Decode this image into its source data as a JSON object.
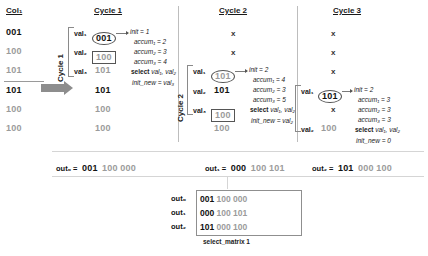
{
  "figure": {
    "col_header": "Col₁",
    "col_values": [
      {
        "text": "001",
        "tone": "dark"
      },
      {
        "text": "100",
        "tone": "gray"
      },
      {
        "text": "101",
        "tone": "gray"
      },
      {
        "text": "101",
        "tone": "dark"
      },
      {
        "text": "100",
        "tone": "gray"
      },
      {
        "text": "100",
        "tone": "gray"
      }
    ],
    "arrow_label": "Cycle 1",
    "cycle2_label": "Cycle 2",
    "cycles": [
      {
        "title": "Cycle 1",
        "rows": [
          {
            "label": "val₁",
            "text": "001",
            "tone": "dark",
            "mark": "circle"
          },
          {
            "label": "val₂",
            "text": "100",
            "tone": "gray",
            "mark": "box"
          },
          {
            "label": "val₃",
            "text": "101",
            "tone": "gray",
            "mark": "none"
          },
          {
            "label": "",
            "text": "101",
            "tone": "dark",
            "mark": "none"
          },
          {
            "label": "",
            "text": "100",
            "tone": "gray",
            "mark": "none"
          },
          {
            "label": "",
            "text": "100",
            "tone": "gray",
            "mark": "none"
          }
        ],
        "annotations": [
          {
            "kind": "italic",
            "text": "init = 1"
          },
          {
            "kind": "italic",
            "text": "accum₁ = 2"
          },
          {
            "kind": "italic",
            "text": "accum₂ = 3"
          },
          {
            "kind": "italic",
            "text": "accum₃ = 4"
          },
          {
            "kind": "select",
            "bold": "select",
            "rest": "val₁, val₂"
          },
          {
            "kind": "italic",
            "text": "init_new  = val₃"
          }
        ]
      },
      {
        "title": "Cycle 2",
        "rows": [
          {
            "label": "",
            "text": "x",
            "tone": "dark",
            "mark": "none"
          },
          {
            "label": "",
            "text": "x",
            "tone": "gray",
            "mark": "none"
          },
          {
            "label": "val₁",
            "text": "101",
            "tone": "gray",
            "mark": "circle"
          },
          {
            "label": "val₂",
            "text": "101",
            "tone": "dark",
            "mark": "none"
          },
          {
            "label": "val₃",
            "text": "100",
            "tone": "gray",
            "mark": "box"
          },
          {
            "label": "",
            "text": "100",
            "tone": "gray",
            "mark": "none"
          }
        ],
        "annotations": [
          {
            "kind": "italic",
            "text": "init = 2"
          },
          {
            "kind": "italic",
            "text": "accum₁ = 4"
          },
          {
            "kind": "italic",
            "text": "accum₂ = 3"
          },
          {
            "kind": "italic",
            "text": "accum₃ = 5"
          },
          {
            "kind": "select",
            "bold": "select",
            "rest": "val₁, val₂"
          },
          {
            "kind": "italic",
            "text": "init_new  = val₂"
          }
        ]
      },
      {
        "title": "Cycle 3",
        "rows": [
          {
            "label": "",
            "text": "x",
            "tone": "dark",
            "mark": "none"
          },
          {
            "label": "",
            "text": "x",
            "tone": "gray",
            "mark": "none"
          },
          {
            "label": "",
            "text": "x",
            "tone": "gray",
            "mark": "none"
          },
          {
            "label": "val₁",
            "text": "101",
            "tone": "dark",
            "mark": "circle"
          },
          {
            "label": "",
            "text": "x",
            "tone": "gray",
            "mark": "none"
          },
          {
            "label": "val₂",
            "text": "100",
            "tone": "gray",
            "mark": "none"
          }
        ],
        "annotations": [
          {
            "kind": "italic",
            "text": "init = 2"
          },
          {
            "kind": "italic",
            "text": "accum₁ = 3"
          },
          {
            "kind": "italic",
            "text": "accum₂ = 3"
          },
          {
            "kind": "italic",
            "text": "accum₃ = 3"
          },
          {
            "kind": "select",
            "bold": "select",
            "rest": "val₁, val₂"
          },
          {
            "kind": "italic",
            "text": "init_new  = 0"
          }
        ]
      }
    ],
    "outputs": [
      {
        "label": "out₀ =",
        "dark": "001",
        "gray": "100 000"
      },
      {
        "label": "out₁ =",
        "dark": "000",
        "gray": "100 101"
      },
      {
        "label": "out₂ =",
        "dark": "101",
        "gray": "000 100"
      }
    ],
    "matrix": {
      "caption": "select_matrix 1",
      "rows": [
        {
          "label": "out₀",
          "dark": "001",
          "gray": "100 000"
        },
        {
          "label": "out₁",
          "dark": "000",
          "gray": "100 101"
        },
        {
          "label": "out₂",
          "dark": "101",
          "gray": "000 100"
        }
      ]
    }
  }
}
